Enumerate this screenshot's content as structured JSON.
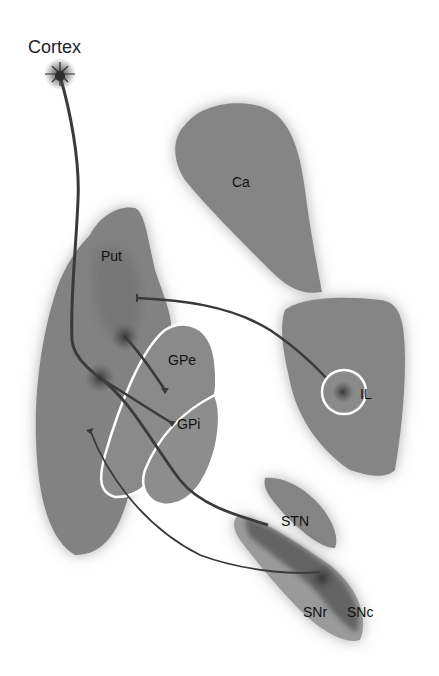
{
  "diagram": {
    "type": "neuroanatomy-basal-ganglia-circuit",
    "colors": {
      "background": "#ffffff",
      "region_fill": "#858585",
      "region_dark": "#5a5a5a",
      "sn_light": "#9a9a9a",
      "axon": "#3a3a3a",
      "outline": "#ffffff",
      "text": "#111111"
    },
    "labels": {
      "cortex": "Cortex",
      "caudate": "Ca",
      "putamen": "Put",
      "gpe": "GPe",
      "gpi": "GPi",
      "intralaminar": "IL",
      "stn": "STN",
      "snr": "SNr",
      "snc": "SNc"
    },
    "regions": [
      {
        "id": "cortex",
        "label": "Cortex",
        "kind": "neuron-origin"
      },
      {
        "id": "caudate",
        "label": "Ca"
      },
      {
        "id": "putamen",
        "label": "Put"
      },
      {
        "id": "gpe",
        "label": "GPe",
        "outlined": true
      },
      {
        "id": "gpi",
        "label": "GPi",
        "outlined": true
      },
      {
        "id": "thalamus-il",
        "label": "IL",
        "outlined_nucleus": true
      },
      {
        "id": "stn",
        "label": "STN"
      },
      {
        "id": "snr",
        "label": "SNr"
      },
      {
        "id": "snc",
        "label": "SNc"
      }
    ],
    "connections": [
      {
        "from": "Cortex",
        "to": "Put"
      },
      {
        "from": "IL",
        "to": "Put"
      },
      {
        "from": "Put",
        "to": "GPe"
      },
      {
        "from": "Put",
        "to": "GPi"
      },
      {
        "from": "Put",
        "to": "SNr"
      },
      {
        "from": "SNc",
        "to": "Put"
      }
    ]
  }
}
